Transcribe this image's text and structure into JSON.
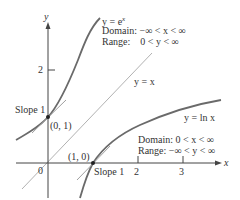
{
  "axes": {
    "x_label": "x",
    "y_label": "y",
    "origin_label": "0",
    "x_ticks": [
      "2",
      "3"
    ],
    "y_ticks": [
      "2"
    ]
  },
  "curves": {
    "exp": {
      "equation": "y = e",
      "exponent": "x",
      "domain_label": "Domain:",
      "domain": "−∞ < x < ∞",
      "range_label": "Range:",
      "range": "0 < y < ∞",
      "color": "#707070"
    },
    "identity": {
      "equation": "y = x",
      "color": "#a0a0a0"
    },
    "ln": {
      "equation": "y = ln x",
      "domain_label": "Domain:",
      "domain": "0 < x < ∞",
      "range_label": "Range:",
      "range": "−∞ < y < ∞",
      "color": "#707070"
    }
  },
  "annotations": {
    "point_exp": "(0, 1)",
    "slope_exp": "Slope 1",
    "point_ln": "(1, 0)",
    "slope_ln": "Slope 1"
  }
}
